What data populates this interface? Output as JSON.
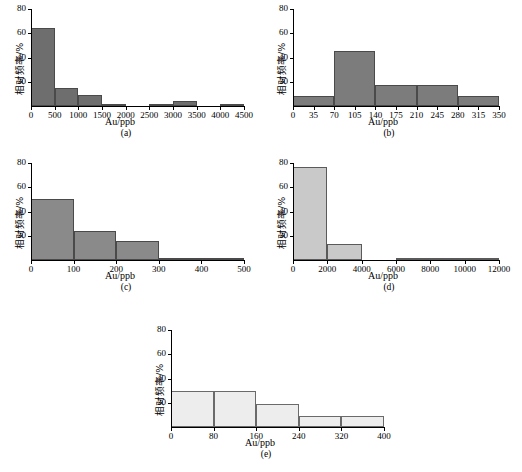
{
  "figure": {
    "shared_xlabel": "Au/ppb",
    "shared_ylabel": "相对频率/%"
  },
  "panels": [
    {
      "caption": "(a)",
      "xlabel": "Au/ppb",
      "ylabel": "相对频率/%",
      "xticks": [
        "0",
        "500",
        "1000",
        "1500",
        "2000",
        "2500",
        "3000",
        "3500",
        "4000",
        "4500"
      ],
      "yticks": [
        "0",
        "20",
        "40",
        "60",
        "80"
      ],
      "bar_color": "#6e6e6e",
      "edge_color": "#4a4a4a"
    },
    {
      "caption": "(b)",
      "xlabel": "Au/ppb",
      "ylabel": "相对频率/%",
      "xticks": [
        "0",
        "35",
        "70",
        "105",
        "140",
        "175",
        "210",
        "245",
        "280",
        "315",
        "350"
      ],
      "yticks": [
        "0",
        "20",
        "40",
        "60",
        "80"
      ],
      "bar_color": "#7c7c7c",
      "edge_color": "#4a4a4a"
    },
    {
      "caption": "(c)",
      "xlabel": "Au/ppb",
      "ylabel": "相对频率/%",
      "xticks": [
        "0",
        "100",
        "200",
        "300",
        "400",
        "500"
      ],
      "yticks": [
        "0",
        "20",
        "40",
        "60",
        "80"
      ],
      "bar_color": "#8a8a8a",
      "edge_color": "#4a4a4a"
    },
    {
      "caption": "(d)",
      "xlabel": "Au/ppb",
      "ylabel": "相对频率/%",
      "xticks": [
        "0",
        "2000",
        "4000",
        "6000",
        "8000",
        "10000",
        "12000"
      ],
      "yticks": [
        "0",
        "20",
        "40",
        "60",
        "80"
      ],
      "bar_color": "#c9c9c9",
      "edge_color": "#5a5a5a"
    },
    {
      "caption": "(e)",
      "xlabel": "Au/ppb",
      "ylabel": "相对频率/%",
      "xticks": [
        "0",
        "80",
        "160",
        "240",
        "320",
        "400"
      ],
      "yticks": [
        "0",
        "20",
        "40",
        "60",
        "80"
      ],
      "bar_color": "#ededed",
      "edge_color": "#6a6a6a"
    }
  ],
  "chart_data": [
    {
      "type": "bar",
      "title": "(a)",
      "xlabel": "Au/ppb",
      "ylabel": "相对频率/%",
      "bin_edges": [
        0,
        500,
        1000,
        1500,
        2000,
        2500,
        3000,
        3500,
        4000,
        4500
      ],
      "categories": [
        "0-500",
        "500-1000",
        "1000-1500",
        "1500-2000",
        "2000-2500",
        "2500-3000",
        "3000-3500",
        "3500-4000",
        "4000-4500"
      ],
      "values": [
        64,
        15,
        9,
        2,
        0,
        2,
        4,
        0,
        2
      ],
      "xlim": [
        0,
        4500
      ],
      "ylim": [
        0,
        80
      ],
      "grid": false,
      "legend": "none"
    },
    {
      "type": "bar",
      "title": "(b)",
      "xlabel": "Au/ppb",
      "ylabel": "相对频率/%",
      "bin_edges": [
        0,
        70,
        140,
        210,
        280,
        350
      ],
      "categories": [
        "0-70",
        "70-140",
        "140-210",
        "210-280",
        "280-350"
      ],
      "values": [
        8,
        45,
        17.5,
        17.5,
        8
      ],
      "xlim": [
        0,
        350
      ],
      "ylim": [
        0,
        80
      ],
      "grid": false,
      "legend": "none"
    },
    {
      "type": "bar",
      "title": "(c)",
      "xlabel": "Au/ppb",
      "ylabel": "相对频率/%",
      "bin_edges": [
        0,
        100,
        200,
        300,
        400,
        500
      ],
      "categories": [
        "0-100",
        "100-200",
        "200-300",
        "300-400",
        "400-500"
      ],
      "values": [
        50,
        24,
        16,
        2,
        2
      ],
      "xlim": [
        0,
        500
      ],
      "ylim": [
        0,
        80
      ],
      "grid": false,
      "legend": "none"
    },
    {
      "type": "bar",
      "title": "(d)",
      "xlabel": "Au/ppb",
      "ylabel": "相对频率/%",
      "bin_edges": [
        0,
        2000,
        4000,
        6000,
        8000,
        10000,
        12000
      ],
      "categories": [
        "0-2000",
        "2000-4000",
        "4000-6000",
        "6000-8000",
        "8000-10000",
        "10000-12000"
      ],
      "values": [
        77,
        13,
        0,
        2,
        2,
        2
      ],
      "xlim": [
        0,
        12000
      ],
      "ylim": [
        0,
        80
      ],
      "grid": false,
      "legend": "none"
    },
    {
      "type": "bar",
      "title": "(e)",
      "xlabel": "Au/ppb",
      "ylabel": "相对频率/%",
      "bin_edges": [
        0,
        80,
        160,
        240,
        320,
        400
      ],
      "categories": [
        "0-80",
        "80-160",
        "160-240",
        "240-320",
        "320-400"
      ],
      "values": [
        30,
        30,
        19,
        9,
        9
      ],
      "xlim": [
        0,
        400
      ],
      "ylim": [
        0,
        80
      ],
      "grid": false,
      "legend": "none"
    }
  ]
}
